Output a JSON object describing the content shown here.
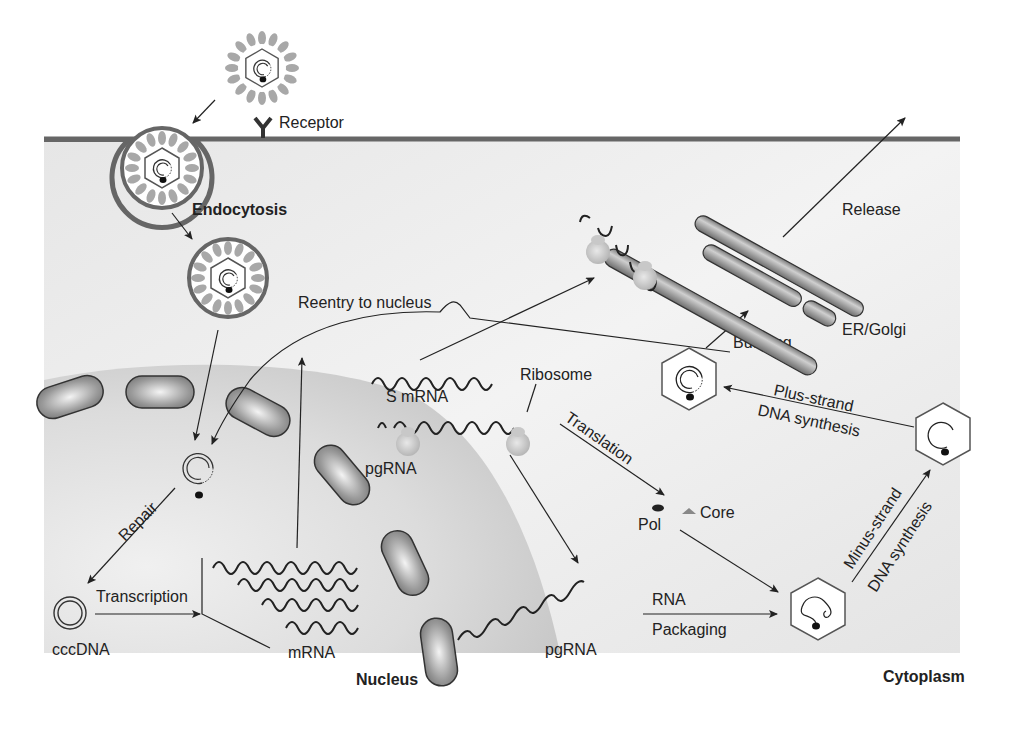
{
  "diagram": {
    "regions": {
      "cytoplasm": "Cytoplasm",
      "nucleus": "Nucleus"
    },
    "labels": {
      "receptor": "Receptor",
      "endocytosis": "Endocytosis",
      "reentry": "Reentry to nucleus",
      "release": "Release",
      "er_golgi": "ER/Golgi",
      "budding": "Budding",
      "s_mrna": "S mRNA",
      "ribosome": "Ribosome",
      "pgrna_top": "pgRNA",
      "translation": "Translation",
      "plus_strand_1": "Plus-strand",
      "plus_strand_2": "DNA synthesis",
      "minus_strand_1": "Minus-strand",
      "minus_strand_2": "DNA synthesis",
      "repair": "Repair",
      "transcription": "Transcription",
      "cccdna": "cccDNA",
      "mrna": "mRNA",
      "pol": "Pol",
      "core": "Core",
      "pgrna_bottom": "pgRNA",
      "rna_packaging_1": "RNA",
      "rna_packaging_2": "Packaging"
    },
    "colors": {
      "cytoplasm": "#e9e9e9",
      "nucleus": "#cfcfcf",
      "membrane": "#6a6a6a",
      "envelope_spikes": "#a9a9a9",
      "pore": "#8f8f8f",
      "ink": "#222222"
    }
  }
}
